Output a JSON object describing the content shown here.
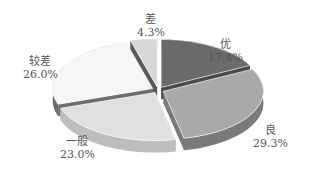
{
  "chart_data": {
    "type": "pie",
    "style": "3d-exploded",
    "title": "",
    "slices": [
      {
        "label": "优",
        "value": 17.4,
        "display": "17.4%",
        "color": "#6b6b6b",
        "side": "#4a4a4a"
      },
      {
        "label": "良",
        "value": 29.3,
        "display": "29.3%",
        "color": "#a9a9a9",
        "side": "#7a7a7a"
      },
      {
        "label": "一般",
        "value": 23.0,
        "display": "23.0%",
        "color": "#e0e0e0",
        "side": "#bdbdbd"
      },
      {
        "label": "较差",
        "value": 26.0,
        "display": "26.0%",
        "color": "#f6f6f6",
        "side": "#6e6e6e"
      },
      {
        "label": "差",
        "value": 4.3,
        "display": "4.3%",
        "color": "#d8d8d8",
        "side": "#5a5a5a"
      }
    ],
    "legend": "none",
    "labels_position": "outside"
  },
  "labels": {
    "you": {
      "name": "优",
      "pct": "17.4%"
    },
    "liang": {
      "name": "良",
      "pct": "29.3%"
    },
    "yiban": {
      "name": "一般",
      "pct": "23.0%"
    },
    "jiaocha": {
      "name": "较差",
      "pct": "26.0%"
    },
    "cha": {
      "name": "差",
      "pct": "4.3%"
    }
  }
}
